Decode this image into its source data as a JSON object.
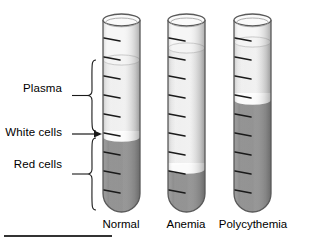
{
  "figure": {
    "title_hidden": "Hematocrit comparison of blood samples in centrifuge tubes",
    "background": "#ffffff"
  },
  "callouts": [
    {
      "id": "plasma",
      "label": "Plasma",
      "marker": "brace",
      "x": 8,
      "y": 88,
      "label_right": 62
    },
    {
      "id": "white-cells",
      "label": "White cells",
      "marker": "arrow",
      "x": 8,
      "y": 128,
      "label_right": 62
    },
    {
      "id": "red-cells",
      "label": "Red cells",
      "marker": "brace",
      "x": 8,
      "y": 165,
      "label_right": 62
    }
  ],
  "tubes": [
    {
      "id": "normal",
      "label": "Normal",
      "label_x": 121,
      "geometry": {
        "left": 103,
        "right": 140,
        "top": 20,
        "bottom": 212,
        "rim_ry": 6
      },
      "layers": [
        {
          "name": "plasma",
          "top": 60,
          "bottom": 131,
          "color": "#ececec"
        },
        {
          "name": "buffy-coat",
          "top": 131,
          "bottom": 137,
          "color": "#fdfdfd"
        },
        {
          "name": "red-cells",
          "top": 137,
          "bottom": 212,
          "color": "#8a8a8a"
        }
      ],
      "fill_top": 60
    },
    {
      "id": "anemia",
      "label": "Anemia",
      "label_x": 186,
      "geometry": {
        "left": 168,
        "right": 205,
        "top": 20,
        "bottom": 212,
        "rim_ry": 6
      },
      "layers": [
        {
          "name": "plasma",
          "top": 48,
          "bottom": 163,
          "color": "#ececec"
        },
        {
          "name": "buffy-coat",
          "top": 163,
          "bottom": 169,
          "color": "#fdfdfd"
        },
        {
          "name": "red-cells",
          "top": 169,
          "bottom": 212,
          "color": "#8a8a8a"
        }
      ],
      "fill_top": 48
    },
    {
      "id": "polycythemia",
      "label": "Polycythemia",
      "label_x": 253,
      "geometry": {
        "left": 234,
        "right": 271,
        "top": 20,
        "bottom": 212,
        "rim_ry": 6
      },
      "layers": [
        {
          "name": "plasma",
          "top": 42,
          "bottom": 93,
          "color": "#ececec"
        },
        {
          "name": "buffy-coat",
          "top": 93,
          "bottom": 100,
          "color": "#fdfdfd"
        },
        {
          "name": "red-cells",
          "top": 100,
          "bottom": 212,
          "color": "#8a8a8a"
        }
      ],
      "fill_top": 42
    }
  ],
  "graduations": {
    "count": 9,
    "start_y": 38,
    "spacing": 19,
    "length": 16,
    "slant": 3,
    "color": "#1a1a1a"
  },
  "colors": {
    "plasma": "#ececec",
    "buffy_coat": "#fdfdfd",
    "red_cells": "#8a8a8a",
    "glass_outline": "#5a5a5a",
    "glass_tint": "#f6f6f6",
    "text": "#000000",
    "rule": "#333333"
  },
  "footer_rule": {
    "x": 4,
    "y": 236,
    "width": 108,
    "thickness": 2
  }
}
